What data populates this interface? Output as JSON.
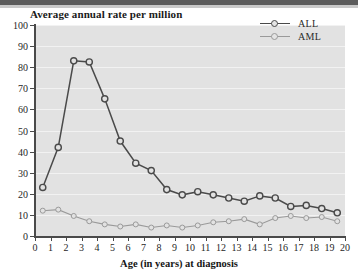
{
  "figure": {
    "title": "Average annual rate per million",
    "background_color": "#e2e2e2",
    "top_strip_color": "#5c5c5c"
  },
  "legend": {
    "position": "top-right",
    "entries": [
      {
        "label": "ALL",
        "color": "#4a4a4a",
        "marker": "open-circle-dark"
      },
      {
        "label": "AML",
        "color": "#9a9a9a",
        "marker": "open-circle-light"
      }
    ]
  },
  "axes": {
    "y": {
      "label": "Average annual rate per million",
      "ticks": [
        "0",
        "10",
        "20",
        "30",
        "40",
        "50",
        "60",
        "70",
        "80",
        "90",
        "100"
      ],
      "min": 0,
      "max": 100,
      "step": 10
    },
    "x": {
      "label": "Age (in years) at diagnosis",
      "ticks": [
        "0",
        "1",
        "2",
        "3",
        "4",
        "5",
        "6",
        "7",
        "8",
        "9",
        "10",
        "11",
        "12",
        "13",
        "14",
        "15",
        "16",
        "17",
        "18",
        "19",
        "20"
      ],
      "min": 0,
      "max": 20,
      "step": 1
    }
  },
  "chart_data": {
    "type": "line",
    "title": "Average annual rate per million",
    "xlabel": "Age (in years) at diagnosis",
    "ylabel": "Average annual rate per million",
    "xlim": [
      0,
      20
    ],
    "ylim": [
      0,
      100
    ],
    "grid": true,
    "legend_position": "top-right",
    "x": [
      0.5,
      1.5,
      2.5,
      3.5,
      4.5,
      5.5,
      6.5,
      7.5,
      8.5,
      9.5,
      10.5,
      11.5,
      12.5,
      13.5,
      14.5,
      15.5,
      16.5,
      17.5,
      18.5,
      19.5
    ],
    "x_tick_labels": [
      "0",
      "1",
      "2",
      "3",
      "4",
      "5",
      "6",
      "7",
      "8",
      "9",
      "10",
      "11",
      "12",
      "13",
      "14",
      "15",
      "16",
      "17",
      "18",
      "19",
      "20"
    ],
    "series": [
      {
        "name": "ALL",
        "color": "#4a4a4a",
        "values": [
          23,
          42,
          83,
          82.5,
          65,
          45,
          34.5,
          31,
          22,
          19.5,
          21,
          19.5,
          18,
          16.5,
          19,
          18,
          14,
          14.5,
          13,
          11
        ]
      },
      {
        "name": "AML",
        "color": "#9a9a9a",
        "values": [
          12,
          12.5,
          9.5,
          7,
          5.5,
          4.5,
          5.5,
          4,
          5,
          4,
          5,
          6.5,
          7,
          8,
          5.5,
          8.5,
          9.5,
          8.5,
          9,
          7
        ]
      }
    ]
  }
}
